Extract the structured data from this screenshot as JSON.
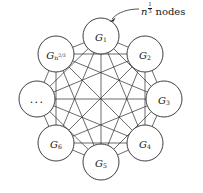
{
  "figure": {
    "width": 203,
    "height": 193,
    "background": "#ffffff",
    "line_color": "#2b2b2b",
    "text_color": "#161616"
  },
  "annotation": {
    "variable": "n",
    "exponent_numerator": "1",
    "exponent_denominator": "3",
    "word": "nodes",
    "full_text": "n^{1/3} nodes",
    "arrow": "curved-arrow-pointing-to-G1"
  },
  "graph": {
    "type": "complete-graph",
    "node_count": 8,
    "edge_count": 28,
    "radius": 63,
    "center_x": 101,
    "center_y": 99,
    "node_radius": 18,
    "nodes": [
      {
        "id": "G1",
        "label_base": "G",
        "label_sub": "1",
        "label_sup": "",
        "display": "G1",
        "cx": 101,
        "cy": 36,
        "angle_deg": 90
      },
      {
        "id": "G2",
        "label_base": "G",
        "label_sub": "2",
        "label_sup": "",
        "display": "G2",
        "cx": 145,
        "cy": 54,
        "angle_deg": 45
      },
      {
        "id": "G3",
        "label_base": "G",
        "label_sub": "3",
        "label_sup": "",
        "display": "G3",
        "cx": 164,
        "cy": 99,
        "angle_deg": 0
      },
      {
        "id": "G4",
        "label_base": "G",
        "label_sub": "4",
        "label_sup": "",
        "display": "G4",
        "cx": 145,
        "cy": 143,
        "angle_deg": 315
      },
      {
        "id": "G5",
        "label_base": "G",
        "label_sub": "5",
        "label_sup": "",
        "display": "G5",
        "cx": 101,
        "cy": 162,
        "angle_deg": 270
      },
      {
        "id": "G6",
        "label_base": "G",
        "label_sub": "6",
        "label_sup": "",
        "display": "G6",
        "cx": 56,
        "cy": 143,
        "angle_deg": 225
      },
      {
        "id": "ellipsis",
        "label_base": "",
        "label_sub": "",
        "label_sup": "",
        "display": "...",
        "cx": 37,
        "cy": 99,
        "angle_deg": 180
      },
      {
        "id": "Gn23",
        "label_base": "G",
        "label_sub": "n",
        "label_sup": "2/3",
        "display": "G_{n^{2/3}}",
        "cx": 56,
        "cy": 54,
        "angle_deg": 135
      }
    ]
  }
}
